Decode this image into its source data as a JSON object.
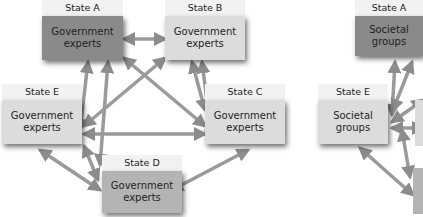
{
  "diagrams": [
    {
      "name": "government-experts-network",
      "nodes": [
        {
          "state": "State A",
          "line1": "Government",
          "line2": "experts"
        },
        {
          "state": "State B",
          "line1": "Government",
          "line2": "experts"
        },
        {
          "state": "State C",
          "line1": "Government",
          "line2": "experts"
        },
        {
          "state": "State D",
          "line1": "Government",
          "line2": "experts"
        },
        {
          "state": "State E",
          "line1": "Government",
          "line2": "experts"
        }
      ]
    },
    {
      "name": "societal-groups-network",
      "nodes": [
        {
          "state": "State A",
          "line1": "Societal",
          "line2": "groups"
        },
        {
          "state": "State E",
          "line1": "Societal",
          "line2": "groups"
        }
      ]
    }
  ],
  "colors": {
    "dark_box": "#8a8a8a",
    "light_box": "#dcdcdc",
    "mid_box": "#b4b4b4",
    "label_bg": "#f2f2f2",
    "arrow": "#8c8c8c"
  }
}
